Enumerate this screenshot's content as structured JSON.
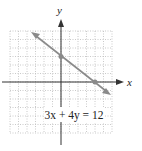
{
  "graph": {
    "x_axis_label": "x",
    "y_axis_label": "y",
    "equation": "3x + 4y = 12",
    "grid": {
      "xmin": -6,
      "xmax": 6,
      "ymin": -6,
      "ymax": 6,
      "step": 1
    },
    "points": [
      {
        "x": 0,
        "y": 3
      },
      {
        "x": 4,
        "y": 0
      }
    ],
    "line_color": "#8a8a8a",
    "grid_color": "#bdbdbd",
    "axis_color": "#333333"
  }
}
